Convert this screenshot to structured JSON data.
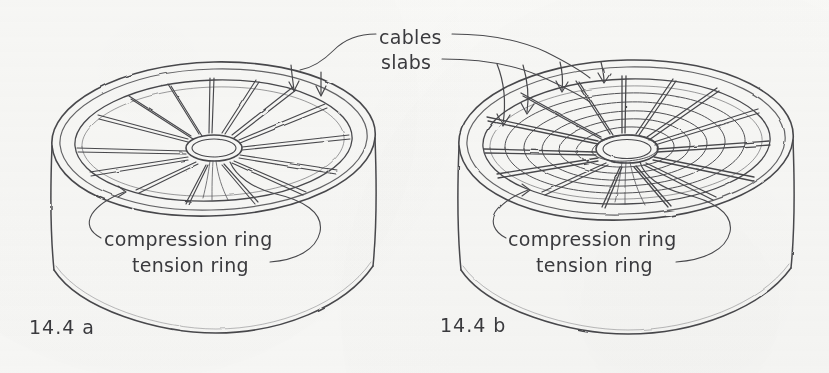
{
  "figure": {
    "domain": "diagram",
    "medium": "hand-drawn pencil sketch on off-white paper",
    "ink_color": "#3b3b3f",
    "paper_color": "#fbfbfa"
  },
  "annotations": {
    "cables_label": "cables",
    "slabs_label": "slabs"
  },
  "panels": [
    {
      "id": "a",
      "figure_number": "14.4 a",
      "caption_compression": "compression ring",
      "caption_tension": "tension ring",
      "roof": {
        "type": "radial-spoke cable roof",
        "radial_cables": 13,
        "concentric_rings": 0,
        "has_slabs": false,
        "load_arrows": 2
      }
    },
    {
      "id": "b",
      "figure_number": "14.4 b",
      "caption_compression": "compression ring",
      "caption_tension": "tension ring",
      "roof": {
        "type": "radial cables with concentric slab rings",
        "radial_cables": 13,
        "concentric_rings": 7,
        "has_slabs": true,
        "load_arrows": 4
      }
    }
  ]
}
